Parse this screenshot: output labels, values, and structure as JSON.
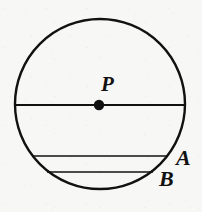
{
  "figure": {
    "type": "geometry-diagram",
    "background_color": "#f7f7f5",
    "ink_color": "#111111",
    "canvas": {
      "width": 202,
      "height": 212
    }
  },
  "labels": {
    "center_point": "P",
    "chord_upper": "A",
    "chord_lower": "B"
  },
  "geometry": {
    "circle": {
      "name": "circle-P",
      "center_x": 100,
      "center_y": 104,
      "radius": 85,
      "stroke_width": 2.4
    },
    "center_dot": {
      "name": "point-P",
      "cx": 99,
      "cy": 105,
      "r": 5.2
    },
    "diameter": {
      "name": "diameter-line",
      "y": 105,
      "x1": 15,
      "x2": 185,
      "stroke_width": 1.8
    },
    "chords": [
      {
        "name": "chord-A",
        "label": "A",
        "y": 156,
        "x1": 33,
        "x2": 167,
        "stroke_width": 1.6
      },
      {
        "name": "chord-B",
        "label": "B",
        "y": 172,
        "x1": 47,
        "x2": 153,
        "stroke_width": 1.6
      }
    ]
  }
}
